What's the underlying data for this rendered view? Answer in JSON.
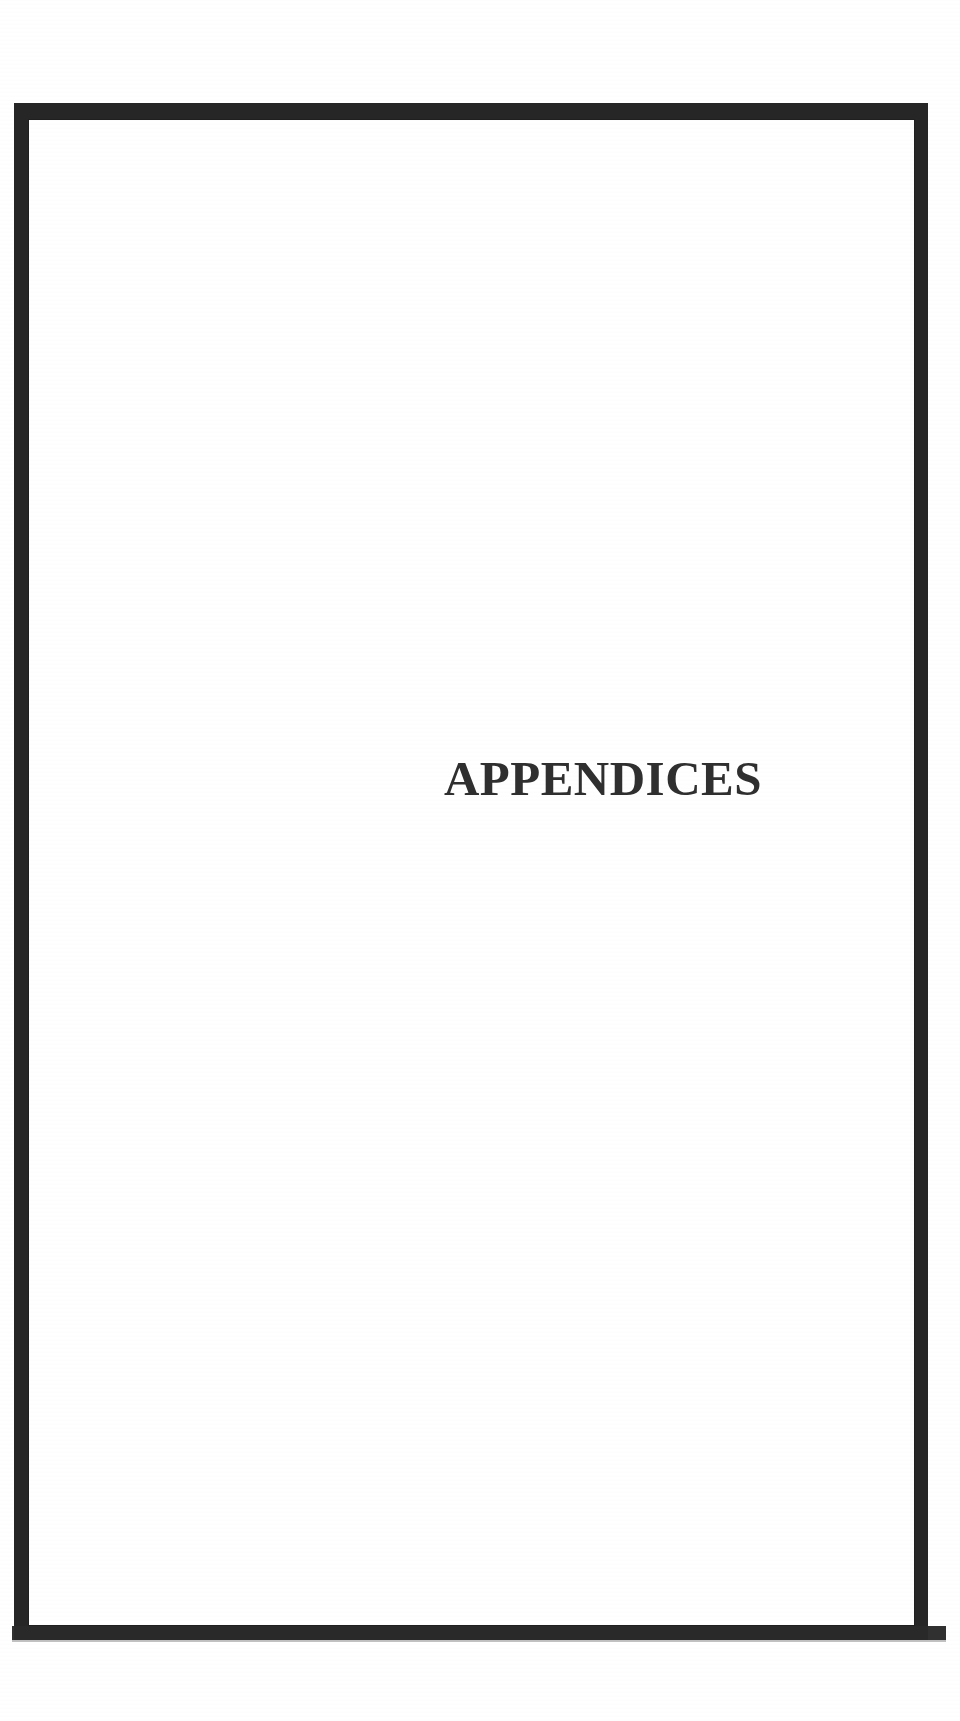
{
  "document": {
    "type": "scanned-section-divider-page",
    "page_background_color": "#ffffff",
    "ink_color": "#2f2f2f",
    "frame_color": "#262626"
  },
  "frame": {
    "name": "page-border-rule",
    "style": "solid heavy rectangle"
  },
  "body": {
    "title": "APPENDICES"
  },
  "artifacts": {
    "bottom_scan_band_color": "#2a2a2a"
  }
}
